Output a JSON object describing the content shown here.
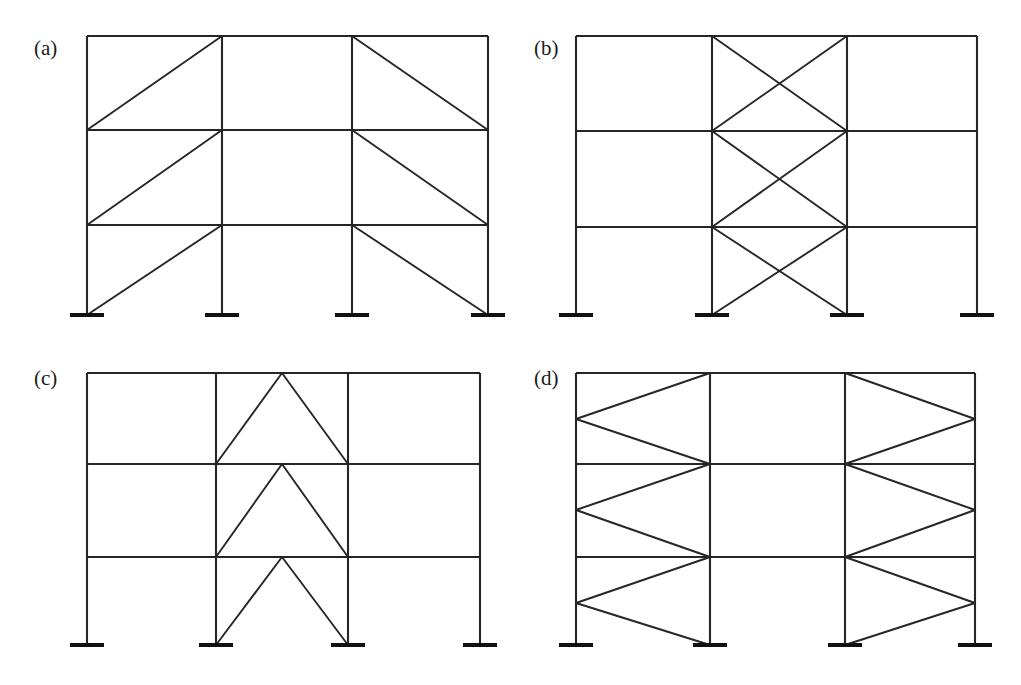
{
  "figure": {
    "background_color": "#ffffff",
    "line_color": "#262626",
    "support_color": "#111111",
    "width": 1021,
    "height": 685
  },
  "panels": [
    {
      "id": "a",
      "label": "(a)",
      "label_x": 34,
      "label_y": 55,
      "bracing_type": "single-diagonal",
      "description": "Three-story four-column frame with single diagonal braces in the outer bays",
      "origin": {
        "x": 87,
        "y": 36
      },
      "columns_x": [
        87,
        222,
        352,
        488
      ],
      "levels_y": [
        36,
        130,
        225,
        315
      ],
      "support_half_width": 17,
      "braces": [
        {
          "story": 3,
          "bay": "left",
          "x1": 87,
          "y1": 130,
          "x2": 222,
          "y2": 36
        },
        {
          "story": 3,
          "bay": "right",
          "x1": 352,
          "y1": 36,
          "x2": 488,
          "y2": 130
        },
        {
          "story": 2,
          "bay": "left",
          "x1": 87,
          "y1": 225,
          "x2": 222,
          "y2": 130
        },
        {
          "story": 2,
          "bay": "right",
          "x1": 352,
          "y1": 130,
          "x2": 488,
          "y2": 225
        },
        {
          "story": 1,
          "bay": "left",
          "x1": 87,
          "y1": 315,
          "x2": 222,
          "y2": 225
        },
        {
          "story": 1,
          "bay": "right",
          "x1": 352,
          "y1": 225,
          "x2": 488,
          "y2": 315
        }
      ]
    },
    {
      "id": "b",
      "label": "(b)",
      "label_x": 534,
      "label_y": 55,
      "bracing_type": "x-braced",
      "description": "Three-story four-column frame with X bracing concentrated in the central bay",
      "origin": {
        "x": 576,
        "y": 36
      },
      "columns_x": [
        576,
        712,
        847,
        977
      ],
      "levels_y": [
        36,
        131,
        227,
        315
      ],
      "support_half_width": 17,
      "braces": [
        {
          "story": 3,
          "bay": "middle",
          "x1": 712,
          "y1": 36,
          "x2": 847,
          "y2": 131
        },
        {
          "story": 3,
          "bay": "middle",
          "x1": 712,
          "y1": 131,
          "x2": 847,
          "y2": 36
        },
        {
          "story": 2,
          "bay": "middle",
          "x1": 712,
          "y1": 131,
          "x2": 847,
          "y2": 227
        },
        {
          "story": 2,
          "bay": "middle",
          "x1": 712,
          "y1": 227,
          "x2": 847,
          "y2": 131
        },
        {
          "story": 1,
          "bay": "middle",
          "x1": 712,
          "y1": 227,
          "x2": 847,
          "y2": 315
        },
        {
          "story": 1,
          "bay": "middle",
          "x1": 712,
          "y1": 315,
          "x2": 847,
          "y2": 227
        }
      ]
    },
    {
      "id": "c",
      "label": "(c)",
      "label_x": 34,
      "label_y": 385,
      "bracing_type": "chevron",
      "description": "Three-story four-column frame with chevron (inverted-V) bracing in the central bay",
      "origin": {
        "x": 87,
        "y": 373
      },
      "columns_x": [
        87,
        216,
        348,
        480
      ],
      "levels_y": [
        373,
        464,
        557,
        645
      ],
      "support_half_width": 17,
      "apex_x": 282,
      "braces": [
        {
          "story": 3,
          "bay": "middle",
          "x1": 216,
          "y1": 464,
          "x2": 282,
          "y2": 373
        },
        {
          "story": 3,
          "bay": "middle",
          "x1": 282,
          "y1": 373,
          "x2": 348,
          "y2": 464
        },
        {
          "story": 2,
          "bay": "middle",
          "x1": 216,
          "y1": 557,
          "x2": 282,
          "y2": 464
        },
        {
          "story": 2,
          "bay": "middle",
          "x1": 282,
          "y1": 464,
          "x2": 348,
          "y2": 557
        },
        {
          "story": 1,
          "bay": "middle",
          "x1": 216,
          "y1": 645,
          "x2": 282,
          "y2": 557
        },
        {
          "story": 1,
          "bay": "middle",
          "x1": 282,
          "y1": 557,
          "x2": 348,
          "y2": 645
        }
      ]
    },
    {
      "id": "d",
      "label": "(d)",
      "label_x": 534,
      "label_y": 385,
      "bracing_type": "knee-braced-horizontal-chevron",
      "description": "Three-story four-column frame with horizontal chevron bracing in the outer bays",
      "origin": {
        "x": 576,
        "y": 373
      },
      "columns_x": [
        576,
        710,
        845,
        975
      ],
      "levels_y": [
        373,
        464,
        557,
        645
      ],
      "support_half_width": 17,
      "braces": [
        {
          "story": 3,
          "bay": "left",
          "x1": 710,
          "y1": 373,
          "x2": 576,
          "y2": 419
        },
        {
          "story": 3,
          "bay": "left",
          "x1": 576,
          "y1": 419,
          "x2": 710,
          "y2": 464
        },
        {
          "story": 3,
          "bay": "right",
          "x1": 845,
          "y1": 373,
          "x2": 975,
          "y2": 419
        },
        {
          "story": 3,
          "bay": "right",
          "x1": 975,
          "y1": 419,
          "x2": 845,
          "y2": 464
        },
        {
          "story": 2,
          "bay": "left",
          "x1": 710,
          "y1": 464,
          "x2": 576,
          "y2": 510
        },
        {
          "story": 2,
          "bay": "left",
          "x1": 576,
          "y1": 510,
          "x2": 710,
          "y2": 557
        },
        {
          "story": 2,
          "bay": "right",
          "x1": 845,
          "y1": 464,
          "x2": 975,
          "y2": 510
        },
        {
          "story": 2,
          "bay": "right",
          "x1": 975,
          "y1": 510,
          "x2": 845,
          "y2": 557
        },
        {
          "story": 1,
          "bay": "left",
          "x1": 710,
          "y1": 557,
          "x2": 576,
          "y2": 603
        },
        {
          "story": 1,
          "bay": "left",
          "x1": 576,
          "y1": 603,
          "x2": 710,
          "y2": 645
        },
        {
          "story": 1,
          "bay": "right",
          "x1": 845,
          "y1": 557,
          "x2": 975,
          "y2": 603
        },
        {
          "story": 1,
          "bay": "right",
          "x1": 975,
          "y1": 603,
          "x2": 845,
          "y2": 645
        }
      ]
    }
  ]
}
